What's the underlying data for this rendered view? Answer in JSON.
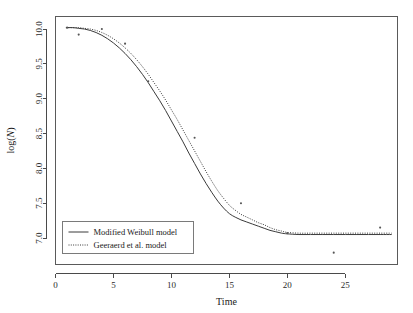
{
  "chart_data": {
    "type": "line",
    "title": "",
    "subtitle": "",
    "xlabel": "Time",
    "ylabel": "log(N)",
    "ylabel_parts": {
      "prefix": "log(",
      "italic": "N",
      "suffix": ")"
    },
    "xlim": [
      0,
      29.5
    ],
    "ylim": [
      6.62,
      10.18
    ],
    "xticks": [
      0,
      5,
      10,
      15,
      20,
      25
    ],
    "xtick_labels": [
      "0",
      "5",
      "10",
      "15",
      "20",
      "25"
    ],
    "yticks": [
      7.0,
      7.5,
      8.0,
      8.5,
      9.0,
      9.5,
      10.0
    ],
    "ytick_labels": [
      "7.0",
      "7.5",
      "8.0",
      "8.5",
      "9.0",
      "9.5",
      "10.0"
    ],
    "grid": false,
    "legend_position": "bottom-left",
    "series": [
      {
        "name": "Modified Weibull model",
        "style": "solid",
        "color": "#3a3a3a",
        "x": [
          0.9,
          1.5,
          2.0,
          2.5,
          3.0,
          3.5,
          4.0,
          4.5,
          5.0,
          5.5,
          6.0,
          6.5,
          7.0,
          7.5,
          8.0,
          8.5,
          9.0,
          9.5,
          10.0,
          10.5,
          11.0,
          11.5,
          12.0,
          12.5,
          13.0,
          13.5,
          14.0,
          14.5,
          15.0,
          15.5,
          16.0,
          16.5,
          17.0,
          17.5,
          18.0,
          18.5,
          19.0,
          19.5,
          20.0,
          21.0,
          22.0,
          23.0,
          24.0,
          25.0,
          26.0,
          27.0,
          28.0,
          29.0
        ],
        "y": [
          10.02,
          10.02,
          10.01,
          10.0,
          9.98,
          9.95,
          9.91,
          9.86,
          9.8,
          9.73,
          9.65,
          9.56,
          9.46,
          9.35,
          9.23,
          9.1,
          8.97,
          8.83,
          8.68,
          8.53,
          8.38,
          8.22,
          8.07,
          7.92,
          7.78,
          7.65,
          7.53,
          7.43,
          7.35,
          7.3,
          7.26,
          7.23,
          7.2,
          7.17,
          7.14,
          7.11,
          7.09,
          7.07,
          7.06,
          7.05,
          7.05,
          7.05,
          7.05,
          7.05,
          7.05,
          7.05,
          7.05,
          7.05
        ]
      },
      {
        "name": "Geeraerd et al. model",
        "style": "dotted",
        "color": "#3a3a3a",
        "x": [
          0.9,
          1.5,
          2.0,
          2.5,
          3.0,
          3.5,
          4.0,
          4.5,
          5.0,
          5.5,
          6.0,
          6.5,
          7.0,
          7.5,
          8.0,
          8.5,
          9.0,
          9.5,
          10.0,
          10.5,
          11.0,
          11.5,
          12.0,
          12.5,
          13.0,
          13.5,
          14.0,
          14.5,
          15.0,
          15.5,
          16.0,
          16.5,
          17.0,
          17.5,
          18.0,
          18.5,
          19.0,
          19.5,
          20.0,
          21.0,
          22.0,
          23.0,
          24.0,
          25.0,
          26.0,
          27.0,
          28.0,
          29.0
        ],
        "y": [
          10.02,
          10.02,
          10.02,
          10.01,
          10.0,
          9.98,
          9.95,
          9.91,
          9.86,
          9.8,
          9.73,
          9.65,
          9.56,
          9.46,
          9.35,
          9.23,
          9.11,
          8.98,
          8.84,
          8.7,
          8.55,
          8.4,
          8.25,
          8.1,
          7.95,
          7.81,
          7.68,
          7.57,
          7.47,
          7.4,
          7.34,
          7.3,
          7.26,
          7.22,
          7.19,
          7.15,
          7.12,
          7.1,
          7.08,
          7.07,
          7.07,
          7.07,
          7.07,
          7.07,
          7.07,
          7.07,
          7.07,
          7.07
        ]
      }
    ],
    "scatter": {
      "name": "observations",
      "marker": "point",
      "color": "#555555",
      "x": [
        1.0,
        2.0,
        4.0,
        6.0,
        8.0,
        12.0,
        16.0,
        20.0,
        24.0,
        28.0
      ],
      "y": [
        10.02,
        9.92,
        10.0,
        9.79,
        9.25,
        8.44,
        7.5,
        7.07,
        6.79,
        7.15
      ]
    },
    "annotations": []
  },
  "legend": {
    "entries": [
      {
        "label": "Modified Weibull model",
        "style": "solid"
      },
      {
        "label": "Geeraerd et al. model",
        "style": "dotted"
      }
    ]
  }
}
